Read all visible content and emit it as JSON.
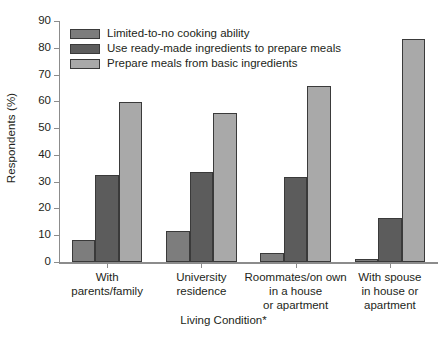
{
  "chart_data": {
    "type": "bar",
    "title": "",
    "xlabel": "Living Condition*",
    "ylabel": "Respondents (%)",
    "ylim": [
      0,
      90
    ],
    "yticks": [
      0,
      10,
      20,
      30,
      40,
      50,
      60,
      70,
      80,
      90
    ],
    "grid": false,
    "legend_position": "top-left inside axes",
    "categories": [
      "With\nparents/family",
      "University\nresidence",
      "Roommates/on own\nin a house\nor apartment",
      "With spouse\nin house or\napartment"
    ],
    "category_lines": [
      [
        "With",
        "parents/family"
      ],
      [
        "University",
        "residence"
      ],
      [
        "Roommates/on own",
        "in a house",
        "or apartment"
      ],
      [
        "With spouse",
        "in house or",
        "apartment"
      ]
    ],
    "series": [
      {
        "name": "Limited-to-no cooking ability",
        "color": "#7d7d7d",
        "values": [
          8.2,
          11.6,
          3.3,
          1.3
        ]
      },
      {
        "name": "Use ready-made ingredients to prepare meals",
        "color": "#5c5c5c",
        "values": [
          32.6,
          33.5,
          31.8,
          16.5
        ]
      },
      {
        "name": "Prepare meals from basic ingredients",
        "color": "#a9a9a9",
        "values": [
          59.8,
          55.5,
          65.9,
          83.2
        ]
      }
    ],
    "ytick_labels": [
      "0",
      "10",
      "20",
      "30",
      "40",
      "50",
      "60",
      "70",
      "80",
      "90"
    ],
    "axis_color": "#8c8c8c",
    "bar_edge_color": "#3a3a3a",
    "text_color": "#231f20"
  }
}
